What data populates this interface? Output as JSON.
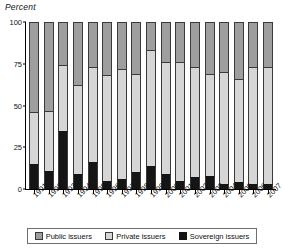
{
  "chart_data": {
    "type": "bar",
    "stacked": true,
    "title": "Percent",
    "xlabel": "",
    "ylabel": "Percent",
    "ylim": [
      0,
      100
    ],
    "yticks": [
      0,
      25,
      50,
      75,
      100
    ],
    "grid": false,
    "legend_position": "bottom",
    "categories": [
      "1991",
      "1992",
      "1993",
      "1994",
      "1995",
      "1996",
      "1997",
      "1998",
      "1999",
      "2000",
      "2001",
      "2002",
      "2003",
      "2004",
      "2005",
      "2006",
      "2007"
    ],
    "series": [
      {
        "name": "Sovereign issuers",
        "color": "#151515",
        "values": [
          15,
          11,
          35,
          9,
          16,
          5,
          6,
          10,
          14,
          9,
          5,
          7,
          8,
          3,
          4,
          3,
          3
        ]
      },
      {
        "name": "Private issuers",
        "color": "#d6d6d6",
        "values": [
          31,
          36,
          39,
          53,
          57,
          63,
          66,
          59,
          69,
          67,
          71,
          66,
          61,
          67,
          62,
          70,
          70
        ]
      },
      {
        "name": "Public issuers",
        "color": "#9e9e9e",
        "values": [
          54,
          53,
          26,
          38,
          27,
          32,
          28,
          31,
          17,
          24,
          24,
          27,
          31,
          30,
          34,
          27,
          27
        ]
      }
    ],
    "cumulative_tops": {
      "sovereign": [
        15,
        11,
        35,
        9,
        16,
        5,
        6,
        10,
        14,
        9,
        5,
        7,
        8,
        3,
        4,
        3,
        3
      ],
      "private": [
        46,
        47,
        74,
        62,
        73,
        68,
        72,
        69,
        83,
        76,
        76,
        73,
        69,
        70,
        66,
        73,
        73
      ],
      "public": [
        100,
        100,
        100,
        100,
        100,
        100,
        100,
        100,
        100,
        100,
        100,
        100,
        100,
        100,
        100,
        100,
        100
      ]
    }
  },
  "legend": {
    "items": [
      {
        "label": "Public issuers",
        "key": "public"
      },
      {
        "label": "Private issuers",
        "key": "private"
      },
      {
        "label": "Sovereign issuers",
        "key": "sovereign"
      }
    ]
  }
}
